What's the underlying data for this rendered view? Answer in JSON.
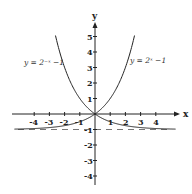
{
  "diagram": {
    "axes": {
      "x_label": "x",
      "y_label": "y",
      "x_ticks": [
        "-4",
        "-3",
        "-2",
        "-1",
        "1",
        "2",
        "3",
        "4"
      ],
      "y_ticks": [
        "5",
        "4",
        "3",
        "2",
        "1",
        "-1",
        "-2",
        "-3",
        "-4"
      ]
    },
    "curves": [
      {
        "label": "y = 2⁻ˣ −1",
        "name": "left-curve"
      },
      {
        "label": "y = 2ˣ −1",
        "name": "right-curve"
      }
    ],
    "asymptote": {
      "y": -1,
      "style": "dashed"
    },
    "colors": {
      "line": "#222222",
      "background": "#ffffff"
    }
  }
}
